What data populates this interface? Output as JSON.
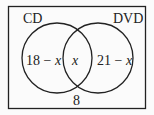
{
  "diagram": {
    "type": "venn",
    "sets": [
      {
        "label": "CD",
        "only_region": "18 − ",
        "only_var": "x"
      },
      {
        "label": "DVD",
        "only_region": "21 − ",
        "only_var": "x"
      }
    ],
    "intersection": "x",
    "outside": "8",
    "colors": {
      "stroke": "#222222",
      "background": "#fbfbfb"
    }
  }
}
